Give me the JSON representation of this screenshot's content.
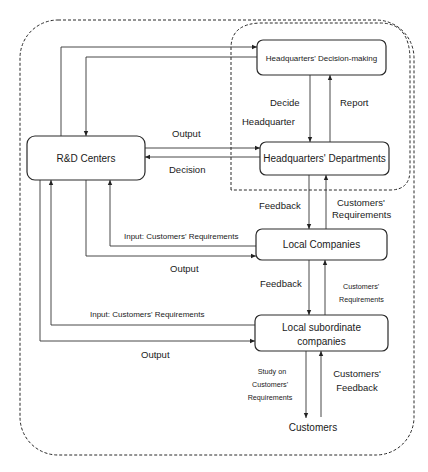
{
  "diagram": {
    "nodes": {
      "hq_decision": "Headquarters' Decision-making",
      "hq_departments": "Headquarters' Departments",
      "rd_centers": "R&D Centers",
      "local_companies": "Local Companies",
      "local_subordinate_line1": "Local subordinate",
      "local_subordinate_line2": "companies",
      "customers": "Customers"
    },
    "groups": {
      "headquarter": "Headquarter"
    },
    "edge_labels": {
      "decide": "Decide",
      "report": "Report",
      "rd_output_hq": "Output",
      "hq_decision_rd": "Decision",
      "feedback_hq_local": "Feedback",
      "cust_req_local_hq_1": "Customers'",
      "cust_req_local_hq_2": "Requirements",
      "input_local_rd": "Input: Customers' Requirements",
      "rd_output_local": "Output",
      "feedback_local_sub": "Feedback",
      "cust_req_sub_local_1": "Customers'",
      "cust_req_sub_local_2": "Requirements",
      "input_sub_rd": "Input: Customers' Requirements",
      "rd_output_sub": "Output",
      "study_1": "Study on",
      "study_2": "Customers'",
      "study_3": "Requirements",
      "cust_feedback_1": "Customers'",
      "cust_feedback_2": "Feedback"
    }
  }
}
